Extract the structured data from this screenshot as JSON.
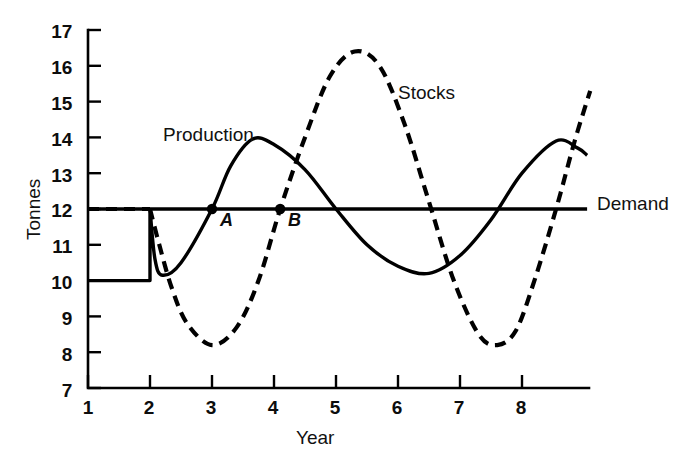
{
  "chart_data": {
    "type": "line",
    "title": "",
    "xlabel": "Year",
    "ylabel": "Tonnes",
    "xlim": [
      1,
      9.1
    ],
    "ylim": [
      7,
      17
    ],
    "xticks": [
      "1",
      "2",
      "3",
      "4",
      "5",
      "6",
      "7",
      "8"
    ],
    "yticks": [
      "17",
      "16",
      "15",
      "14",
      "13",
      "12",
      "11",
      "10",
      "9",
      "8",
      "7"
    ],
    "grid": false,
    "legend": "inline-labels",
    "series": [
      {
        "name": "Demand",
        "style": "solid",
        "color": "#000000",
        "description": "Flat horizontal line held constant at 12 tonnes across all years",
        "points": [
          {
            "x": 1.0,
            "y": 12.0
          },
          {
            "x": 9.05,
            "y": 12.0
          }
        ]
      },
      {
        "name": "Production",
        "style": "solid",
        "color": "#000000",
        "description": "Constant at 10 until year 2, steps up to 12, dips back toward 10 then oscillates peaking near 14 at year 3.2 and 13.9 at year 8.5, trough 10.2 at year 6.5",
        "points": [
          {
            "x": 1.0,
            "y": 10.0
          },
          {
            "x": 2.0,
            "y": 10.0
          },
          {
            "x": 2.0,
            "y": 12.0
          },
          {
            "x": 2.08,
            "y": 10.6
          },
          {
            "x": 2.2,
            "y": 10.15
          },
          {
            "x": 2.5,
            "y": 10.5
          },
          {
            "x": 3.0,
            "y": 12.0
          },
          {
            "x": 3.3,
            "y": 13.2
          },
          {
            "x": 3.65,
            "y": 13.95
          },
          {
            "x": 4.0,
            "y": 13.8
          },
          {
            "x": 4.5,
            "y": 13.1
          },
          {
            "x": 5.0,
            "y": 12.0
          },
          {
            "x": 5.5,
            "y": 11.0
          },
          {
            "x": 6.0,
            "y": 10.4
          },
          {
            "x": 6.5,
            "y": 10.2
          },
          {
            "x": 7.0,
            "y": 10.7
          },
          {
            "x": 7.5,
            "y": 11.7
          },
          {
            "x": 8.0,
            "y": 13.0
          },
          {
            "x": 8.55,
            "y": 13.9
          },
          {
            "x": 8.9,
            "y": 13.7
          },
          {
            "x": 9.05,
            "y": 13.5
          }
        ]
      },
      {
        "name": "Stocks",
        "style": "dashed",
        "color": "#000000",
        "description": "Equal to 12 until year 2, falls to trough 8.2 at year 3, rises to peak 16.4 at year 5.3, falls to trough 8.2 at year 7.5, rises to 15.3 at right edge",
        "points": [
          {
            "x": 1.0,
            "y": 12.0
          },
          {
            "x": 2.0,
            "y": 12.0
          },
          {
            "x": 2.15,
            "y": 11.0
          },
          {
            "x": 2.35,
            "y": 9.8
          },
          {
            "x": 2.6,
            "y": 8.8
          },
          {
            "x": 3.0,
            "y": 8.2
          },
          {
            "x": 3.4,
            "y": 8.7
          },
          {
            "x": 3.75,
            "y": 10.0
          },
          {
            "x": 4.1,
            "y": 12.0
          },
          {
            "x": 4.5,
            "y": 14.0
          },
          {
            "x": 4.9,
            "y": 15.7
          },
          {
            "x": 5.3,
            "y": 16.4
          },
          {
            "x": 5.7,
            "y": 16.0
          },
          {
            "x": 6.1,
            "y": 14.4
          },
          {
            "x": 6.5,
            "y": 12.2
          },
          {
            "x": 6.9,
            "y": 10.0
          },
          {
            "x": 7.3,
            "y": 8.5
          },
          {
            "x": 7.6,
            "y": 8.2
          },
          {
            "x": 7.9,
            "y": 8.6
          },
          {
            "x": 8.2,
            "y": 10.0
          },
          {
            "x": 8.55,
            "y": 12.0
          },
          {
            "x": 8.85,
            "y": 13.9
          },
          {
            "x": 9.1,
            "y": 15.3
          }
        ]
      }
    ],
    "annotations": [
      {
        "id": "A",
        "label": "A",
        "x": 3.0,
        "y": 12.0,
        "marker": "dot",
        "note": "Production crosses Demand"
      },
      {
        "id": "B",
        "label": "B",
        "x": 4.1,
        "y": 12.0,
        "marker": "dot",
        "note": "Stocks crosses Demand"
      }
    ],
    "series_labels": [
      {
        "text": "Production",
        "x": 2.5,
        "y": 14.0
      },
      {
        "text": "Stocks",
        "x": 6.05,
        "y": 15.45
      },
      {
        "text": "Demand",
        "x": 9.2,
        "y": 12.05
      }
    ]
  }
}
